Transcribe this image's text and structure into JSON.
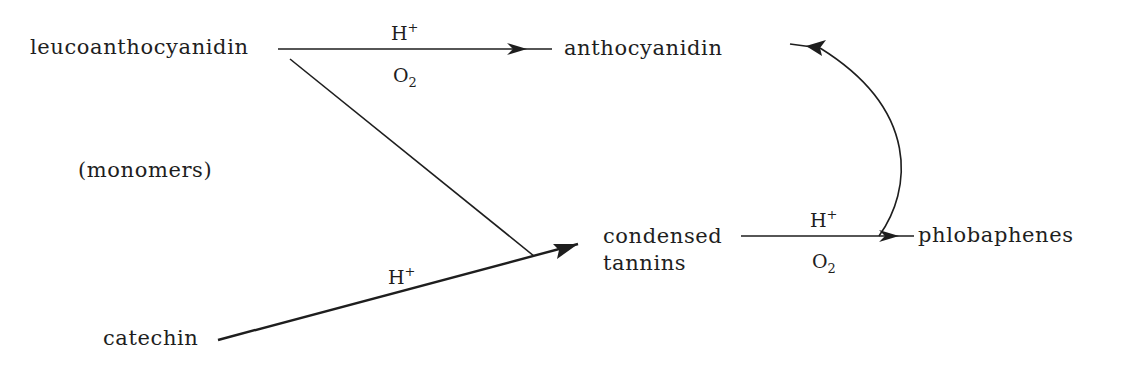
{
  "diagram": {
    "type": "reaction-scheme",
    "nodes": {
      "leucoanthocyanidin": "leucoanthocyanidin",
      "anthocyanidin": "anthocyanidin",
      "monomers_note": "(monomers)",
      "condensed_tannins_line1": "condensed",
      "condensed_tannins_line2": "tannins",
      "phlobaphenes": "phlobaphenes",
      "catechin": "catechin"
    },
    "reactions": [
      {
        "from": "leucoanthocyanidin",
        "to": "anthocyanidin",
        "above": {
          "base": "H",
          "sup": "+"
        },
        "below": {
          "base": "O",
          "sub": "2"
        }
      },
      {
        "from": "leucoanthocyanidin",
        "to": "condensed tannins",
        "above": null,
        "below": null
      },
      {
        "from": "catechin",
        "to": "condensed tannins",
        "above": {
          "base": "H",
          "sup": "+"
        },
        "below": null
      },
      {
        "from": "condensed tannins",
        "to": "phlobaphenes",
        "above": {
          "base": "H",
          "sup": "+"
        },
        "below": {
          "base": "O",
          "sub": "2"
        }
      },
      {
        "from": "phlobaphenes",
        "to": "anthocyanidin",
        "above": null,
        "below": null
      }
    ]
  }
}
